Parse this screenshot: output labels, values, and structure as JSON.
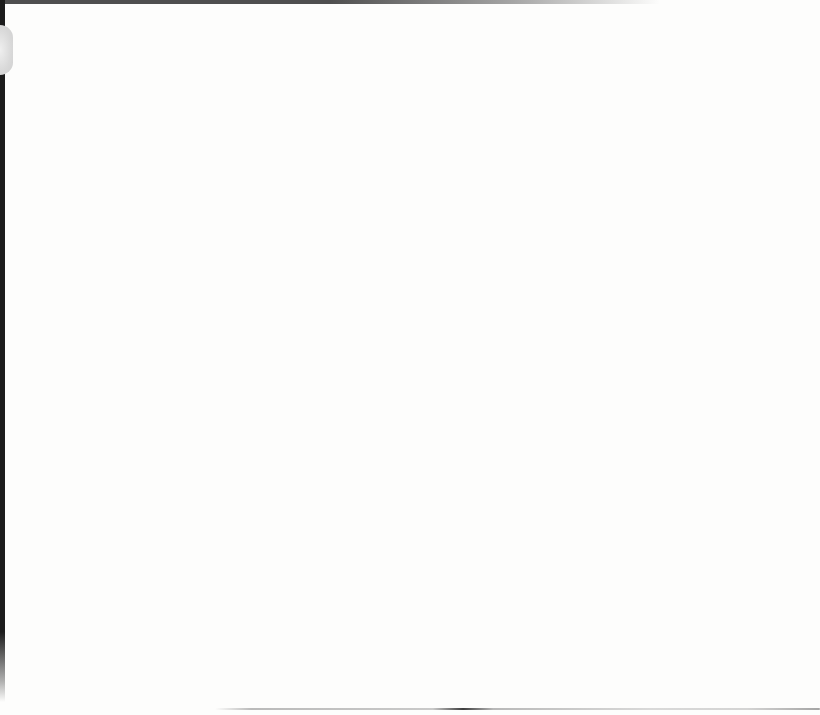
{
  "document": {
    "kind": "scanned blank book page",
    "visible_text": ""
  },
  "artifacts": {
    "spine_bar": {
      "name": "book-spine-edge",
      "description": "dark vertical scan gutter along the left edge, top to near bottom",
      "color": "#1c1c1c"
    },
    "top_edge_shadow": {
      "name": "top-scan-edge-shadow",
      "description": "dark horizontal scanner edge shadow along the top, fading out toward the right around x=650",
      "color": "#4f4f4f"
    },
    "thumb_notch": {
      "name": "page-curl-bump",
      "description": "small light gray rounded bump on the left edge near the top (y≈25–75)",
      "color": "#d9d9d9"
    },
    "bottom_crease": {
      "name": "bottom-crease-line",
      "description": "thin gray crease line near the bottom edge (y≈708) from x≈215 to right edge, with darker smudge near x≈460",
      "color": "#6f6f6f"
    }
  },
  "colors": {
    "paper": "#fdfdfc",
    "spine": "#1c1c1c",
    "edge_dark": "#4f4f4f",
    "notch": "#d9d9d9"
  }
}
